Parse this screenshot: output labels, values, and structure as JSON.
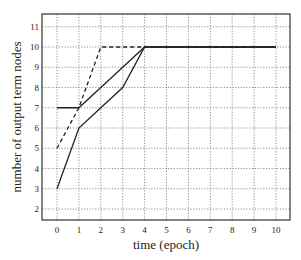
{
  "chart_data": {
    "type": "line",
    "title": "",
    "xlabel": "time (epoch)",
    "ylabel": "number of output term nodes",
    "xlim": [
      -0.7,
      10.6
    ],
    "ylim": [
      1.4,
      11.6
    ],
    "xticks": [
      0,
      1,
      2,
      3,
      4,
      5,
      6,
      7,
      8,
      9,
      10
    ],
    "yticks": [
      2,
      3,
      4,
      5,
      6,
      7,
      8,
      9,
      10,
      11
    ],
    "grid": true,
    "legend": null,
    "series": [
      {
        "name": "dashed",
        "style": "dashed",
        "x": [
          0,
          1,
          2,
          3,
          4,
          5,
          6,
          7,
          8,
          9,
          10
        ],
        "values": [
          5,
          7,
          10,
          10,
          10,
          10,
          10,
          10,
          10,
          10,
          10
        ]
      },
      {
        "name": "solid-upper",
        "style": "solid",
        "x": [
          0,
          1,
          2,
          3,
          4,
          5,
          6,
          7,
          8,
          9,
          10
        ],
        "values": [
          7,
          7,
          8,
          9,
          10,
          10,
          10,
          10,
          10,
          10,
          10
        ]
      },
      {
        "name": "solid-lower",
        "style": "solid",
        "x": [
          0,
          1,
          2,
          3,
          4,
          5,
          6,
          7,
          8,
          9,
          10
        ],
        "values": [
          3,
          6,
          7,
          8,
          10,
          10,
          10,
          10,
          10,
          10,
          10
        ]
      }
    ]
  },
  "labels": {
    "xlabel": "time (epoch)",
    "ylabel": "number of output term nodes"
  }
}
